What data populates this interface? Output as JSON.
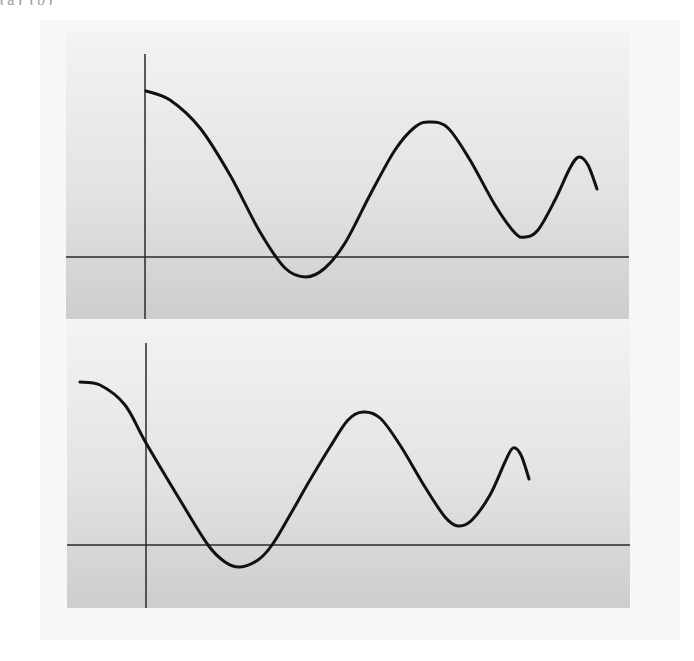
{
  "figure": {
    "caption_fragment": "(a)              (b)",
    "background": "#ffffff",
    "outer_glow": "#f3f3f3",
    "panel_top_color": "#f3f3f3",
    "panel_mid_color": "#e3e3e3",
    "panel_bottom_color": "#cdcdcd",
    "axis_color": "#2a2a2a",
    "curve_color": "#111111"
  },
  "panels": [
    {
      "name": "top-panel",
      "rect": {
        "x": 66,
        "y": 32,
        "w": 563,
        "h": 287
      },
      "y_axis": {
        "x": 145,
        "y1": 54,
        "y2": 319
      },
      "x_axis": {
        "y": 257,
        "x1": 66,
        "x2": 629
      },
      "curve_points": [
        [
          146,
          91
        ],
        [
          170,
          100
        ],
        [
          200,
          128
        ],
        [
          230,
          175
        ],
        [
          260,
          232
        ],
        [
          285,
          268
        ],
        [
          306,
          277
        ],
        [
          325,
          268
        ],
        [
          345,
          243
        ],
        [
          370,
          195
        ],
        [
          395,
          150
        ],
        [
          415,
          127
        ],
        [
          430,
          122
        ],
        [
          448,
          128
        ],
        [
          470,
          160
        ],
        [
          495,
          205
        ],
        [
          515,
          233
        ],
        [
          525,
          237
        ],
        [
          538,
          230
        ],
        [
          555,
          200
        ],
        [
          570,
          168
        ],
        [
          579,
          157
        ],
        [
          588,
          165
        ],
        [
          597,
          189
        ]
      ]
    },
    {
      "name": "bottom-panel",
      "rect": {
        "x": 67,
        "y": 320,
        "w": 563,
        "h": 288
      },
      "y_axis": {
        "x": 146,
        "y1": 343,
        "y2": 608
      },
      "x_axis": {
        "y": 545,
        "x1": 67,
        "x2": 630
      },
      "curve_points": [
        [
          80,
          382
        ],
        [
          100,
          385
        ],
        [
          125,
          405
        ],
        [
          146,
          443
        ],
        [
          180,
          500
        ],
        [
          208,
          545
        ],
        [
          225,
          562
        ],
        [
          240,
          567
        ],
        [
          258,
          560
        ],
        [
          272,
          545
        ],
        [
          290,
          515
        ],
        [
          310,
          480
        ],
        [
          330,
          447
        ],
        [
          348,
          420
        ],
        [
          363,
          412
        ],
        [
          380,
          418
        ],
        [
          400,
          445
        ],
        [
          425,
          487
        ],
        [
          445,
          517
        ],
        [
          458,
          526
        ],
        [
          472,
          520
        ],
        [
          490,
          495
        ],
        [
          505,
          462
        ],
        [
          513,
          448
        ],
        [
          521,
          455
        ],
        [
          529,
          479
        ]
      ]
    }
  ]
}
